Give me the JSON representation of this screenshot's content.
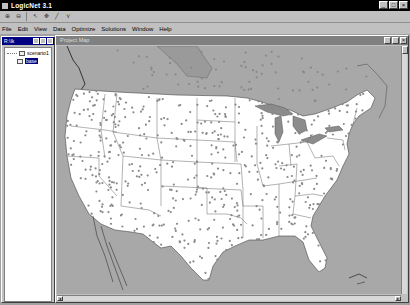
{
  "app": {
    "title": "LogicNet 3.1",
    "window_buttons": [
      "_",
      "□",
      "×"
    ]
  },
  "toolbar": {
    "buttons": [
      {
        "name": "zoom-in",
        "glyph": "⊕"
      },
      {
        "name": "zoom-out",
        "glyph": "⊖"
      },
      {
        "name": "select",
        "glyph": "↖"
      },
      {
        "name": "pan",
        "glyph": "✥"
      },
      {
        "name": "draw",
        "glyph": "╱"
      },
      {
        "name": "route",
        "glyph": "⋎"
      }
    ]
  },
  "menu": {
    "items": [
      "File",
      "Edit",
      "View",
      "Data",
      "Optimize",
      "Solutions",
      "Window",
      "Help"
    ]
  },
  "tree_window": {
    "title": "R:\\Ik",
    "items": [
      {
        "label": "scenario1",
        "selected": false
      },
      {
        "label": "base",
        "selected": true
      }
    ]
  },
  "map_window": {
    "title": "Project Map",
    "colors": {
      "land_us": "#ffffff",
      "background": "#a8a8a8",
      "canada": "#a8a8a8",
      "lakes": "#8c8c8c",
      "borders": "#555555",
      "points": "#8a8a8a"
    }
  }
}
